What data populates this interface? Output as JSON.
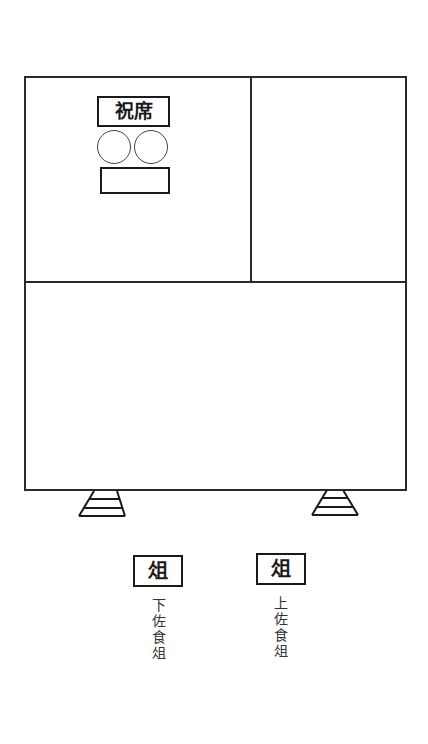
{
  "diagram": {
    "type": "floor-plan",
    "room": {
      "sections": [
        "upper-left",
        "upper-right",
        "lower"
      ]
    },
    "seat": {
      "label": "祝席",
      "vessels": [
        {
          "shape": "circle",
          "position": "left"
        },
        {
          "shape": "circle",
          "position": "right"
        }
      ],
      "plate": {
        "shape": "rectangle"
      }
    },
    "stairs": [
      {
        "position": "left",
        "steps": 3
      },
      {
        "position": "right",
        "steps": 3
      }
    ],
    "stands": [
      {
        "position": "left",
        "box_label": "俎",
        "caption": "下佐食俎"
      },
      {
        "position": "right",
        "box_label": "俎",
        "caption": "上佐食俎"
      }
    ]
  },
  "colors": {
    "line": "#2a2a2a",
    "background": "#ffffff",
    "text": "#1a1a1a"
  }
}
